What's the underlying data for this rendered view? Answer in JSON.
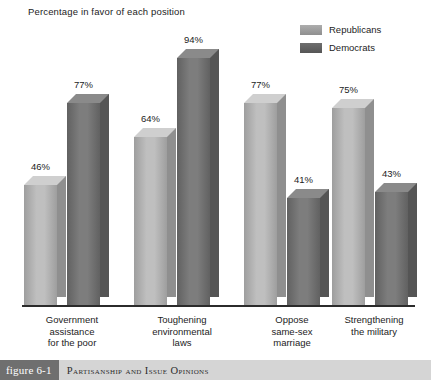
{
  "chart_data": {
    "type": "bar",
    "title": "Percentage in favor of each position",
    "xlabel": "",
    "ylabel": "",
    "ylim": [
      0,
      100
    ],
    "grid": false,
    "legend_position": "top-right",
    "categories": [
      "Government assistance for the poor",
      "Toughening environmental laws",
      "Oppose same-sex marriage",
      "Strengthening the military"
    ],
    "category_lines": [
      [
        "Government",
        "assistance",
        "for the poor"
      ],
      [
        "Toughening",
        "environmental",
        "laws"
      ],
      [
        "Oppose",
        "same-sex",
        "marriage"
      ],
      [
        "Strengthening",
        "the military"
      ]
    ],
    "series": [
      {
        "name": "Republicans",
        "color": "#ADADAD",
        "values": [
          46,
          64,
          77,
          75
        ],
        "labels": [
          "46%",
          "64%",
          "77%",
          "75%"
        ]
      },
      {
        "name": "Democrats",
        "color": "#6E6E6E",
        "values": [
          77,
          94,
          41,
          43
        ],
        "labels": [
          "77%",
          "94%",
          "41%",
          "43%"
        ]
      }
    ]
  },
  "legend": {
    "items": [
      {
        "label": "Republicans",
        "color": "#ADADAD"
      },
      {
        "label": "Democrats",
        "color": "#6E6E6E"
      }
    ]
  },
  "caption": {
    "tag": "figure 6-1",
    "text": "Partisanship and Issue Opinions"
  },
  "colors": {
    "republican_front_light": "#BFBFBF",
    "republican_front_dark": "#9E9E9E",
    "republican_side": "#8F8F8F",
    "republican_top": "#CFCFCF",
    "democrat_front_light": "#7D7D7D",
    "democrat_front_dark": "#616161",
    "democrat_side": "#555555",
    "democrat_top": "#8A8A8A",
    "axis": "#2B2B2B",
    "caption_tag_bg": "#6F6F6F",
    "caption_band_bg": "#D5D5D5"
  }
}
